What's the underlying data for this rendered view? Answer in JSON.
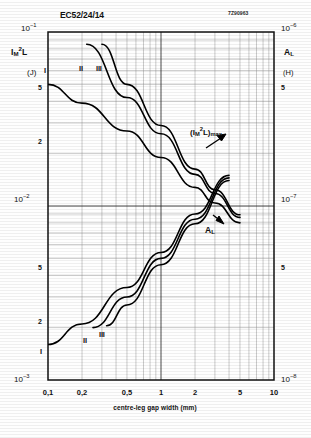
{
  "header": {
    "core_type": "EC52/24/14",
    "doc_ref": "7Z90963"
  },
  "axes": {
    "y_left": {
      "title": "I M 2 L",
      "unit": "(J)",
      "top_label": "10-1",
      "mid_label": "10-2",
      "bottom_label": "10-3",
      "minor_5a": "5",
      "minor_2a": "2",
      "minor_5b": "5",
      "minor_2b": "2"
    },
    "y_right": {
      "title": "AL",
      "unit": "(H)",
      "top_label": "10-6",
      "mid_label": "10-7",
      "bottom_label": "10-8",
      "minor_5a": "5",
      "minor_5b": "5"
    },
    "x": {
      "title": "centre-leg gap width  (mm)",
      "ticks": [
        "0,1",
        "0,2",
        "0,5",
        "1",
        "2",
        "5",
        "10"
      ]
    }
  },
  "annotations": {
    "imax": "(IM2L)max",
    "al": "AL"
  },
  "curve_labels": {
    "top_I": "I",
    "top_II": "II",
    "top_III": "III",
    "bottom_I": "I",
    "bottom_II": "II",
    "bottom_III": "III"
  },
  "chart_data": {
    "type": "line",
    "title": "EC52/24/14",
    "xlabel": "centre-leg gap width (mm)",
    "ylabel": "IM2L (J)",
    "y2label": "AL (H)",
    "xscale": "log",
    "yscale": "log",
    "xlim": [
      0.1,
      10
    ],
    "ylim": [
      0.001,
      0.1
    ],
    "y2lim": [
      1e-08,
      1e-06
    ],
    "grid": true,
    "legend": "none",
    "xticks": [
      0.1,
      0.2,
      0.5,
      1,
      2,
      5,
      10
    ],
    "yticks": [
      0.001,
      0.002,
      0.005,
      0.01,
      0.02,
      0.05,
      0.1
    ],
    "y2ticks": [
      1e-08,
      5e-08,
      1e-07,
      5e-07,
      1e-06
    ],
    "series": [
      {
        "name": "I",
        "quantity": "IM2L_max",
        "axis": "left",
        "x": [
          0.1,
          0.2,
          0.5,
          1.0,
          2.0,
          3.0,
          5.0
        ],
        "y": [
          0.05,
          0.039,
          0.027,
          0.019,
          0.0128,
          0.0104,
          0.008
        ]
      },
      {
        "name": "II",
        "quantity": "IM2L_max",
        "axis": "left",
        "x": [
          0.22,
          0.5,
          1.0,
          2.0,
          3.0,
          5.0
        ],
        "y": [
          0.085,
          0.042,
          0.026,
          0.0152,
          0.0118,
          0.0086
        ]
      },
      {
        "name": "III",
        "quantity": "IM2L_max",
        "axis": "left",
        "x": [
          0.3,
          0.5,
          1.0,
          2.0,
          3.0,
          5.0
        ],
        "y": [
          0.085,
          0.05,
          0.029,
          0.0163,
          0.0124,
          0.0089
        ]
      },
      {
        "name": "I",
        "quantity": "AL",
        "axis": "right",
        "x": [
          0.1,
          0.2,
          0.5,
          1.0,
          2.0,
          4.0
        ],
        "y": [
          1.6e-08,
          2.1e-08,
          3.4e-08,
          5.4e-08,
          9e-08,
          1.5e-07
        ]
      },
      {
        "name": "II",
        "quantity": "AL",
        "axis": "right",
        "x": [
          0.25,
          0.5,
          1.0,
          2.0,
          4.0
        ],
        "y": [
          2e-08,
          3e-08,
          5e-08,
          8.4e-08,
          1.45e-07
        ]
      },
      {
        "name": "III",
        "quantity": "AL",
        "axis": "right",
        "x": [
          0.33,
          0.5,
          1.0,
          2.0,
          4.0
        ],
        "y": [
          2.05e-08,
          2.7e-08,
          4.6e-08,
          7.9e-08,
          1.4e-07
        ]
      }
    ]
  }
}
